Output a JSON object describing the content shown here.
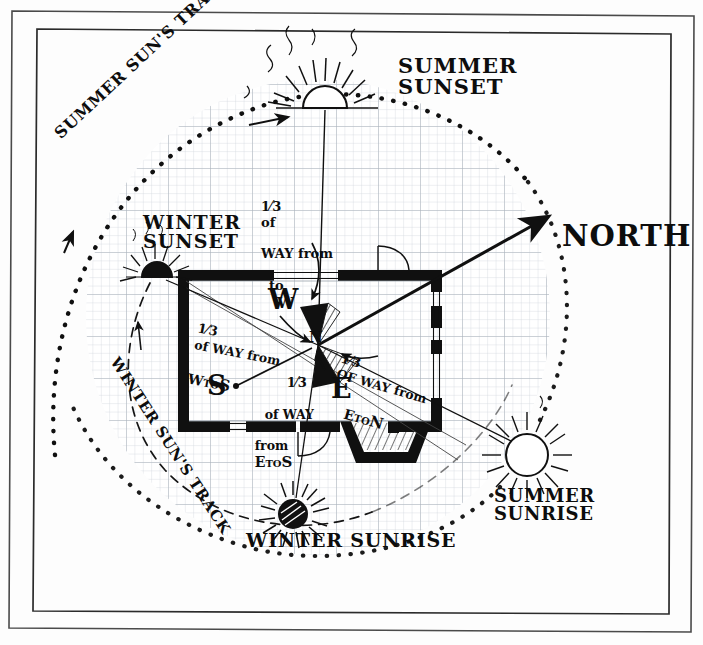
{
  "meta": {
    "style": "hand-drawn ink on graph paper",
    "paper_color": "#fefefe",
    "ink_color": "#0d0d0d",
    "grid_color": "#c9cfd6",
    "grid_major_color": "#aeb6bf"
  },
  "labels": {
    "north": "NORTH",
    "summer_sunset": "SUMMER\nSUNSET",
    "winter_sunset": "WINTER\nSUNSET",
    "summer_sunrise": "SUMMER\nSUNRISE",
    "winter_sunrise": "WINTER SUNRISE",
    "summer_track": "SUMMER SUN'S TRACK",
    "winter_track": "WINTER SUN'S TRACK"
  },
  "cardinals": [
    {
      "key": "W",
      "label": "W"
    },
    {
      "key": "S",
      "label": "S"
    },
    {
      "key": "E",
      "label": "E"
    }
  ],
  "annotations": [
    {
      "id": "w-to-n",
      "lines": [
        "1/3 of",
        "WAY from",
        "to      W",
        "        N"
      ],
      "plain": "1/3 of WAY from W to N",
      "numerator": "1",
      "denominator": "3",
      "from": "W",
      "to": "N"
    },
    {
      "id": "w-to-s",
      "lines": [
        "1/3 of WAY from",
        "W TO S"
      ],
      "plain": "1/3 of WAY from W TO S",
      "numerator": "1",
      "denominator": "3",
      "from": "W",
      "to": "S"
    },
    {
      "id": "e-to-n",
      "lines": [
        "1/3 OF WAY from",
        "E TO N"
      ],
      "plain": "1/3 OF WAY from E TO N",
      "numerator": "1",
      "denominator": "3",
      "from": "E",
      "to": "N"
    },
    {
      "id": "e-to-s",
      "lines": [
        "1/3",
        "of WAY",
        "from E TO S"
      ],
      "plain": "1/3 of WAY from E TO S",
      "numerator": "1",
      "denominator": "3",
      "from": "E",
      "to": "S"
    }
  ],
  "annotation_fragments": {
    "w_to_n_l1_of": "of",
    "w_to_n_l2": "WAY from",
    "w_to_n_to": "to",
    "w_to_n_w": "W",
    "w_to_n_n": "N",
    "w_to_s_l1": "of WAY from",
    "w_to_s_w": "W",
    "w_to_s_to": "TO",
    "w_to_s_s": "S",
    "e_to_n_l1": "OF WAY from",
    "e_to_n_e": "E",
    "e_to_n_to": "TO",
    "e_to_n_n": "N",
    "e_to_s_l1": "of WAY",
    "e_to_s_from": "from",
    "e_to_s_e": "E",
    "e_to_s_to": "TO",
    "e_to_s_s": "S",
    "one": "1",
    "three": "3",
    "slash": "⁄"
  },
  "suns": [
    {
      "id": "summer-sunset",
      "fill": "open",
      "x": 325,
      "y": 93,
      "r": 20,
      "label_ref": "summer_sunset"
    },
    {
      "id": "winter-sunset",
      "fill": "filled",
      "x": 157,
      "y": 271,
      "r": 13,
      "label_ref": "winter_sunset"
    },
    {
      "id": "winter-sunrise",
      "fill": "filled",
      "x": 293,
      "y": 514,
      "r": 14,
      "label_ref": "winter_sunrise"
    },
    {
      "id": "summer-sunrise",
      "fill": "open",
      "x": 527,
      "y": 455,
      "r": 20,
      "label_ref": "summer_sunrise"
    }
  ],
  "tracks": [
    {
      "id": "summer-track",
      "style": "dotted",
      "label_ref": "summer_track"
    },
    {
      "id": "winter-track",
      "style": "dashed",
      "label_ref": "winter_track"
    }
  ],
  "building": {
    "name": "house-plan",
    "features": [
      "north-door",
      "south-door",
      "bay-window",
      "east-windows",
      "hearth-hatching"
    ]
  },
  "center_sectors": [
    {
      "id": "north-west-wedge",
      "hatched": true
    },
    {
      "id": "south-east-wedge",
      "hatched": true
    }
  ]
}
